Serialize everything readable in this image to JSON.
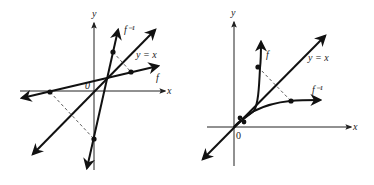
{
  "figures": [
    {
      "id": "linear",
      "axis_x_label": "x",
      "axis_y_label": "y",
      "origin_label": "0",
      "f_label": "f",
      "finv_label": "f⁻¹",
      "identity_label": "y = x"
    },
    {
      "id": "nonlinear",
      "axis_x_label": "x",
      "axis_y_label": "y",
      "origin_label": "0",
      "f_label": "f",
      "finv_label": "f⁻¹",
      "identity_label": "y = x"
    }
  ],
  "colors": {
    "ink": "#111111",
    "background": "#ffffff"
  }
}
